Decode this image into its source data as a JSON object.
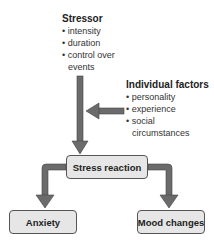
{
  "stressor": {
    "title": "Stressor",
    "items": [
      "• intensity",
      "• duration",
      "• control over",
      "events"
    ]
  },
  "individual_factors": {
    "title": "Individual factors",
    "items": [
      "• personality",
      "• experience",
      "• social",
      "circumstances"
    ]
  },
  "nodes": {
    "stress_reaction": "Stress reaction",
    "anxiety": "Anxiety",
    "mood_changes": "Mood changes"
  },
  "colors": {
    "arrow_fill": "#6b6b6b",
    "arrow_stroke": "#444444",
    "box_fill": "#e6e6e6",
    "box_border": "#555555"
  }
}
